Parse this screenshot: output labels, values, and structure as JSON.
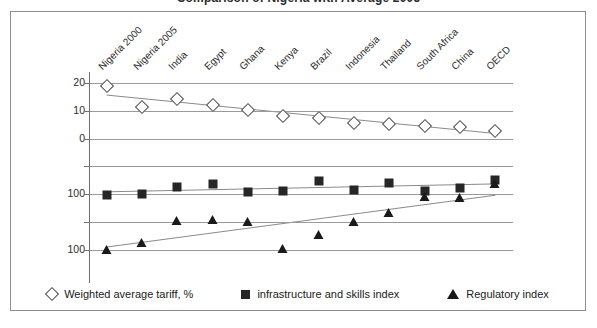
{
  "title": "Comparison of Nigeria with Average 2005",
  "chart_data": {
    "type": "scatter",
    "title": "Comparison of Nigeria with Average 2005",
    "xlabel": "",
    "ylabel": "",
    "grid": true,
    "legend_position": "bottom",
    "categories": [
      "Nigeria 2000",
      "Nigeria 2005",
      "India",
      "Egypt",
      "Ghana",
      "Kenya",
      "Brazil",
      "Indonesia",
      "Thailand",
      "South Africa",
      "China",
      "OECD"
    ],
    "yaxis_ticks": [
      {
        "label": "20",
        "value": 20
      },
      {
        "label": "10",
        "value": 10
      },
      {
        "label": "0",
        "value": 0
      },
      {
        "label": "",
        "value": -10
      },
      {
        "label": "100",
        "value": -20
      },
      {
        "label": "",
        "value": -30
      },
      {
        "label": "100",
        "value": -40
      }
    ],
    "ylim": [
      -47,
      24
    ],
    "series": [
      {
        "name": "Weighted average tariff, %",
        "marker": "diamond",
        "trendline": true,
        "values": [
          19.0,
          11.3,
          14.3,
          12.0,
          10.4,
          8.2,
          7.6,
          5.6,
          5.2,
          4.6,
          4.3,
          2.6
        ]
      },
      {
        "name": "infrastructure and skills index",
        "marker": "square",
        "trendline": true,
        "values": [
          -20.2,
          -19.9,
          -17.5,
          -16.3,
          -19.1,
          -18.8,
          -15.3,
          -18.4,
          -15.9,
          -18.9,
          -17.9,
          -14.9
        ]
      },
      {
        "name": "Regulatory index",
        "marker": "triangle",
        "trendline": true,
        "values": [
          -40.1,
          -37.8,
          -29.6,
          -29.2,
          -30.0,
          -39.9,
          -34.8,
          -30.0,
          -26.8,
          -21.0,
          -21.3,
          -16.5
        ]
      }
    ]
  },
  "legend": [
    {
      "marker": "diamond",
      "label": "Weighted average tariff, %"
    },
    {
      "marker": "square",
      "label": "infrastructure and skills index"
    },
    {
      "marker": "triangle",
      "label": "Regulatory index"
    }
  ]
}
